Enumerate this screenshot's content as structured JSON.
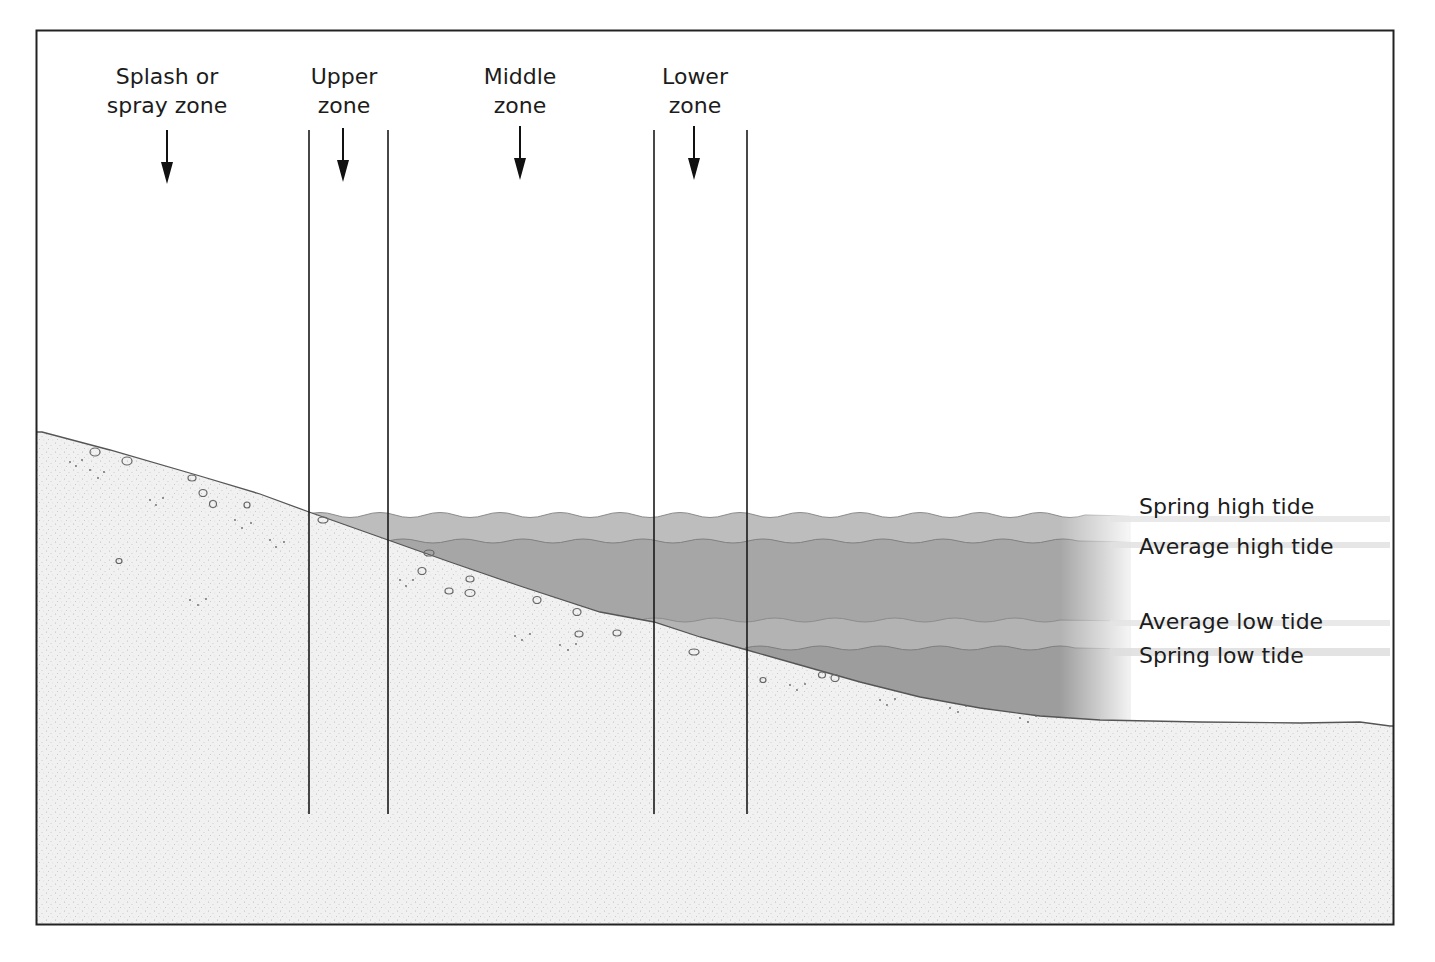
{
  "diagram": {
    "type": "intertidal-zonation-cross-section",
    "zones": [
      {
        "id": "splash",
        "line1": "Splash or",
        "line2": "spray zone",
        "x": 167
      },
      {
        "id": "upper",
        "line1": "Upper",
        "line2": "zone",
        "x": 343
      },
      {
        "id": "middle",
        "line1": "Middle",
        "line2": "zone",
        "x": 520
      },
      {
        "id": "lower",
        "line1": "Lower",
        "line2": "zone",
        "x": 695
      }
    ],
    "tide_levels": [
      {
        "id": "spring-high",
        "label": "Spring high tide",
        "y": 507
      },
      {
        "id": "average-high",
        "label": "Average high tide",
        "y": 547
      },
      {
        "id": "average-low",
        "label": "Average low tide",
        "y": 622
      },
      {
        "id": "spring-low",
        "label": "Spring low tide",
        "y": 656
      }
    ],
    "colors": {
      "frame": "#222222",
      "sand": "#efefef",
      "water_light": "#b9b9b9",
      "water_dark": "#9e9e9e",
      "ink": "#1c1c1c"
    }
  }
}
